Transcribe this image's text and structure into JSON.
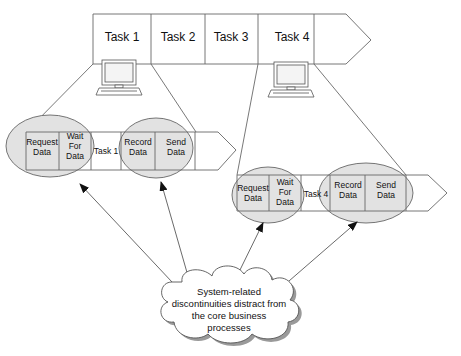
{
  "top_process": {
    "tasks": [
      "Task 1",
      "Task 2",
      "Task 3",
      "Task 4"
    ]
  },
  "left_process": {
    "steps": [
      {
        "lines": [
          "Request",
          "Data"
        ]
      },
      {
        "lines": [
          "Wait",
          "For",
          "Data"
        ]
      },
      {
        "lines": [
          "Task 1"
        ]
      },
      {
        "lines": [
          "Record",
          "Data"
        ]
      },
      {
        "lines": [
          "Send",
          "Data"
        ]
      }
    ]
  },
  "right_process": {
    "steps": [
      {
        "lines": [
          "Request",
          "Data"
        ]
      },
      {
        "lines": [
          "Wait",
          "For",
          "Data"
        ]
      },
      {
        "lines": [
          "Task 4"
        ]
      },
      {
        "lines": [
          "Record",
          "Data"
        ]
      },
      {
        "lines": [
          "Send",
          "Data"
        ]
      }
    ]
  },
  "cloud": {
    "lines": [
      "System-related",
      "discontinuities distract from",
      "the core business",
      "processes"
    ]
  },
  "icons": [
    "computer-icon-task1",
    "computer-icon-task4"
  ],
  "colors": {
    "line": "#555555",
    "ellipse_fill": "#e4e4e4",
    "cloud_shadow": "#999999"
  }
}
